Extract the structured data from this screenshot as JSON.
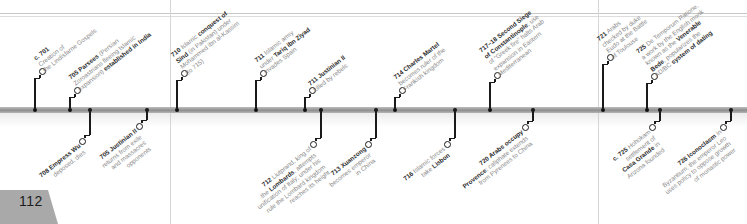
{
  "page": {
    "number": "112"
  },
  "timeline": {
    "events": [
      {
        "id": "e701",
        "side": "up",
        "year": "c. 701",
        "parts": [
          " Creation of",
          "the ",
          "Lindisfarne Gospels"
        ]
      },
      {
        "id": "e705a",
        "side": "up",
        "year": "705",
        "bold": "Parsees",
        "text": "(Persian Zoroastrians fleeing Islamic expansion)",
        "bold2": "established in India"
      },
      {
        "id": "e708",
        "side": "down",
        "year": "708",
        "bold": "Empress Wu",
        "text": "deposed, dies"
      },
      {
        "id": "e705b",
        "side": "down",
        "year": "705",
        "bold": "Justinian II",
        "text": "returns from exile and massacres opponents"
      },
      {
        "id": "e710",
        "side": "up",
        "year": "710",
        "pre": "Islamic",
        "bold": "conquest of Sind",
        "text": "(in Pakistan) under Mohammed ibn al-Kassim (to 715)"
      },
      {
        "id": "e711a",
        "side": "up",
        "year": "711",
        "pre": "Islamic army under",
        "bold": "Tariq ibn Ziyad",
        "text": "invades Spain"
      },
      {
        "id": "e711b",
        "side": "up",
        "year": "711",
        "bold": "Justinian II",
        "text": "killed by rebels"
      },
      {
        "id": "e712",
        "side": "down",
        "year": "712",
        "pre": "Liutprand, king of the",
        "bold": "Lombards",
        "text": ", attempts unification of Italy; under his rule the Lombard kingdom reaches its height"
      },
      {
        "id": "e713",
        "side": "down",
        "year": "713",
        "bold": "Xuanzong",
        "text": "becomes emperor in China"
      },
      {
        "id": "e714",
        "side": "up",
        "year": "714",
        "bold": "Charles Martel",
        "text": "becomes ruler of the Frankish kingdom"
      },
      {
        "id": "e716",
        "side": "down",
        "year": "716",
        "pre": "Islamic forces take",
        "bold": "Lisbon"
      },
      {
        "id": "e717",
        "side": "up",
        "year": "717–18",
        "bold": "Second Siege of Constantinople",
        "text": ": use of “Greek fire” halts Arab expansion in Eastern Mediterranean"
      },
      {
        "id": "e720",
        "side": "down",
        "year": "720",
        "bold": "Arabs occupy Provence",
        "text": "; caliphate extends from Pyrenees to China"
      },
      {
        "id": "e721",
        "side": "up",
        "year": "721",
        "text": "Arabs checked by duke Eudo at the Battle of Toulouse"
      },
      {
        "id": "e725a",
        "side": "up",
        "year": "725",
        "italic": "De Temporum Ratione",
        "text": ", a work by the English monk known as the",
        "bold": "Venerable Bede",
        "text2": ", popularizes the ",
        "text3": "AD/BC",
        "bold2": "system of dating"
      },
      {
        "id": "e725b",
        "side": "down",
        "year": "c. 725",
        "pre": "Hohokam settlement of",
        "bold": "Casa Grande",
        "text": "in Arizona founded"
      },
      {
        "id": "e726",
        "side": "down",
        "year": "726",
        "bold": "Iconoclasm",
        "text": "in Byzantium: the emperor Leo uses policy to oppose growth of monastic power"
      }
    ],
    "lines": {
      "l701": [
        "c. 701",
        " Creation of",
        "the Lindisfarne Gospels"
      ],
      "l705a": [
        "705 Parsees (Persian",
        "Zoroastrians fleeing Islamic",
        "expansion) established in India"
      ],
      "l708": [
        "708 Empress Wu",
        "deposed, dies"
      ],
      "l705b": [
        "705 Justinian II",
        "returns from exile",
        "and massacres",
        "opponents"
      ],
      "l710": [
        "710 Islamic conquest of",
        "Sind (in Pakistan) under",
        "Mohammed ibn al-Kassim",
        "(to 715)"
      ],
      "l711a": [
        "711 Islamic army",
        "under Tariq ibn Ziyad",
        "invades Spain"
      ],
      "l711b": [
        "711 Justinian II",
        "killed by rebels"
      ],
      "l712": [
        "712 Liutprand, king of",
        "the Lombards, attempts",
        "unification of Italy; under his",
        "rule the Lombard kingdom",
        "reaches its height"
      ],
      "l713": [
        "713 Xuanzong",
        "becomes emperor",
        "in China"
      ],
      "l714": [
        "714 Charles Martel",
        "becomes ruler of the",
        "Frankish kingdom"
      ],
      "l716": [
        "716 Islamic forces",
        "take Lisbon"
      ],
      "l717": [
        "717–18 Second Siege",
        "of Constantinople; use",
        "of “Greek fire” halts Arab",
        "expansion in Eastern",
        "Mediterranean"
      ],
      "l720": [
        "720 Arabs occupy",
        "Provence; caliphate extends",
        "from Pyrenees to China"
      ],
      "l721": [
        "721 Arabs",
        "checked by duke",
        "Eudo at the Battle",
        "of Toulouse"
      ],
      "l725a": [
        "725 De Temporum Ratione,",
        "a work by the English monk",
        "known as the Venerable",
        "Bede, popularizes the",
        "AD/BC system of dating"
      ],
      "l725b": [
        "c. 725 Hohokam",
        "settlement of",
        "Casa Grande in",
        "Arizona founded"
      ],
      "l726": [
        "726 Iconoclasm in",
        "Byzantium: the emperor Leo",
        "uses policy to oppose growth",
        "of monastic power"
      ]
    }
  }
}
